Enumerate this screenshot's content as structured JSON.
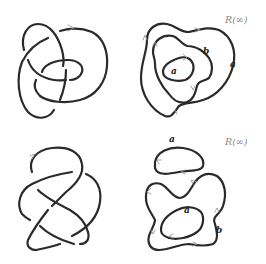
{
  "figure": {
    "panels": [
      {
        "id": "knot-top",
        "kind": "knot-diagram",
        "strand_color": "#2a2a2a"
      },
      {
        "id": "graph-top",
        "kind": "state-diagram",
        "title": "R(∞)",
        "labels": [
          {
            "text": "b",
            "x": 70,
            "y": 52
          },
          {
            "text": "a",
            "x": 38,
            "y": 65
          },
          {
            "text": "a",
            "x": 96,
            "y": 60
          }
        ]
      },
      {
        "id": "knot-bottom",
        "kind": "knot-diagram",
        "strand_color": "#2a2a2a"
      },
      {
        "id": "graph-bottom",
        "kind": "state-diagram",
        "title": "R(∞)",
        "labels": [
          {
            "text": "a",
            "x": 35,
            "y": 2
          },
          {
            "text": "a",
            "x": 50,
            "y": 72
          },
          {
            "text": "b",
            "x": 82,
            "y": 95
          }
        ]
      }
    ],
    "colors": {
      "stroke": "#2a2a2a",
      "arrow": "#9a9a9a",
      "title": "#8a8a8a",
      "background": "#ffffff"
    }
  }
}
